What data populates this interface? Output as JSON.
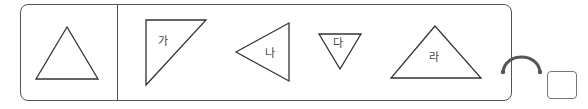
{
  "reference_shape": {
    "type": "equilateral-triangle"
  },
  "options": [
    {
      "label": "가",
      "shape": "right-triangle"
    },
    {
      "label": "나",
      "shape": "triangle-pointing-left"
    },
    {
      "label": "다",
      "shape": "inverted-triangle"
    },
    {
      "label": "라",
      "shape": "obtuse-triangle"
    }
  ],
  "answer_box": {
    "value": ""
  },
  "colors": {
    "stroke": "#333333",
    "border": "#555555"
  }
}
